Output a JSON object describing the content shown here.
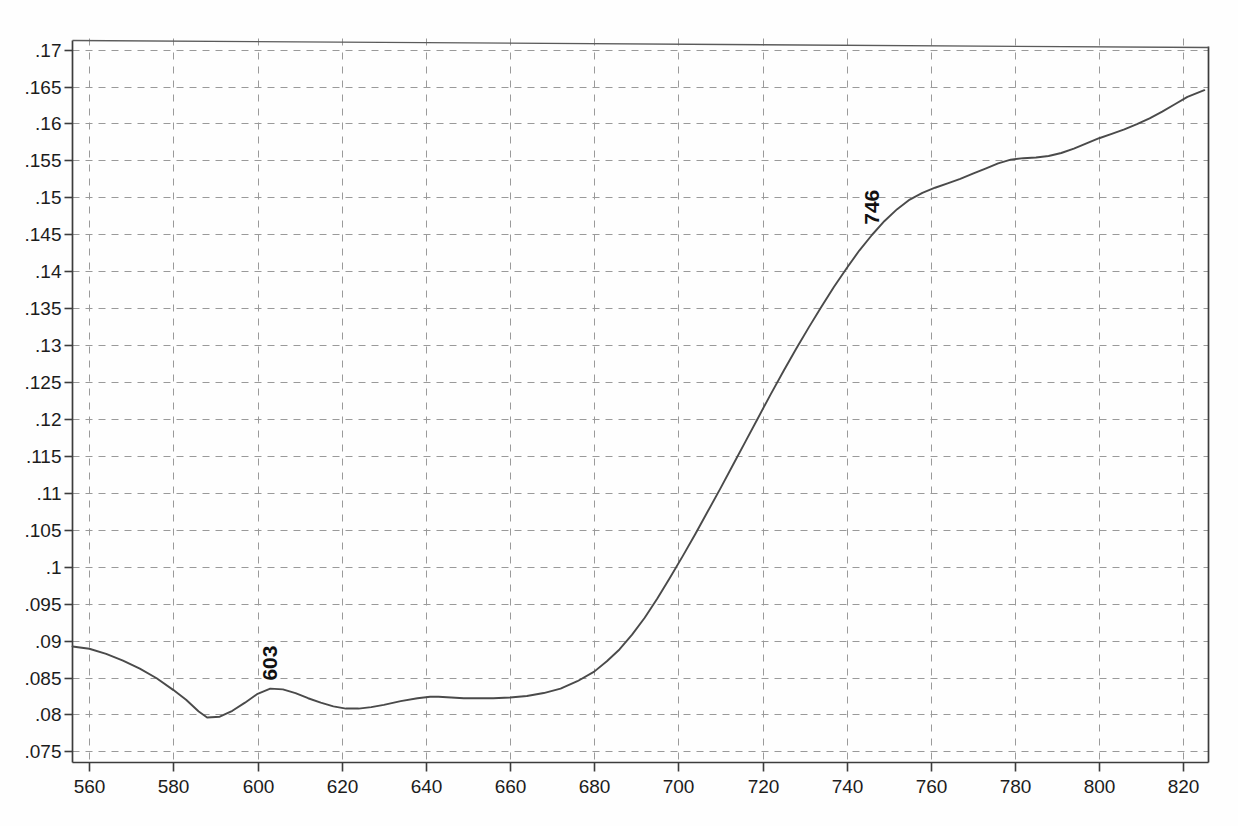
{
  "chart_data": {
    "type": "line",
    "title": "",
    "subtitle": "",
    "xlabel": "",
    "ylabel": "",
    "xlim": [
      556,
      826
    ],
    "ylim": [
      0.0735,
      0.1715
    ],
    "grid": true,
    "legend_position": "none",
    "x_tick_labels": [
      "560",
      "580",
      "600",
      "620",
      "640",
      "660",
      "680",
      "700",
      "720",
      "740",
      "760",
      "780",
      "800",
      "820"
    ],
    "x_ticks": [
      560,
      580,
      600,
      620,
      640,
      660,
      680,
      700,
      720,
      740,
      760,
      780,
      800,
      820
    ],
    "y_tick_labels": [
      ".17",
      ".165",
      ".16",
      ".155",
      ".15",
      ".145",
      ".14",
      ".135",
      ".13",
      ".125",
      ".12",
      ".115",
      ".11",
      ".105",
      ".1",
      ".095",
      ".09",
      ".085",
      ".08",
      ".075"
    ],
    "y_ticks": [
      0.17,
      0.165,
      0.16,
      0.155,
      0.15,
      0.145,
      0.14,
      0.135,
      0.13,
      0.125,
      0.12,
      0.115,
      0.11,
      0.105,
      0.1,
      0.095,
      0.09,
      0.085,
      0.08,
      0.075
    ],
    "line_color": "#4a4a4a",
    "grid_color": "#9a9a9a",
    "axis_color": "#3c3c3c",
    "annotations": [
      {
        "label": "603",
        "x": 603,
        "y": 0.0835,
        "rotation": -90
      },
      {
        "label": "746",
        "x": 746,
        "y": 0.1452,
        "rotation": -90
      }
    ],
    "series": [
      {
        "name": "absorbance",
        "x": [
          556,
          560,
          564,
          568,
          572,
          576,
          580,
          583,
          586,
          588,
          591,
          594,
          597,
          600,
          603,
          606,
          609,
          612,
          615,
          618,
          621,
          624,
          627,
          630,
          634,
          638,
          641,
          643,
          646,
          649,
          652,
          656,
          660,
          664,
          668,
          672,
          676,
          680,
          683,
          686,
          689,
          692,
          695,
          698,
          701,
          704,
          707,
          710,
          713,
          716,
          719,
          722,
          725,
          728,
          731,
          734,
          737,
          740,
          743,
          746,
          749,
          752,
          755,
          758,
          761,
          764,
          767,
          770,
          773,
          776,
          779,
          782,
          785,
          788,
          791,
          794,
          797,
          800,
          803,
          806,
          809,
          812,
          815,
          818,
          821,
          825
        ],
        "values": [
          0.0892,
          0.0889,
          0.0882,
          0.0873,
          0.0862,
          0.0849,
          0.0833,
          0.082,
          0.0804,
          0.0796,
          0.0797,
          0.0805,
          0.0816,
          0.0828,
          0.0835,
          0.0834,
          0.0829,
          0.0822,
          0.0816,
          0.0811,
          0.0808,
          0.0808,
          0.081,
          0.0813,
          0.0818,
          0.0822,
          0.0824,
          0.0824,
          0.0823,
          0.0822,
          0.0822,
          0.0822,
          0.0823,
          0.0825,
          0.0829,
          0.0835,
          0.0845,
          0.0858,
          0.0872,
          0.0888,
          0.0908,
          0.0931,
          0.0957,
          0.0985,
          0.1014,
          0.1044,
          0.1075,
          0.1106,
          0.1138,
          0.117,
          0.1202,
          0.1234,
          0.1265,
          0.1295,
          0.1324,
          0.1352,
          0.1379,
          0.1404,
          0.1428,
          0.1449,
          0.1468,
          0.1484,
          0.1497,
          0.1506,
          0.1513,
          0.1519,
          0.1525,
          0.1532,
          0.1539,
          0.1546,
          0.1551,
          0.1553,
          0.1554,
          0.1556,
          0.156,
          0.1566,
          0.1573,
          0.158,
          0.1586,
          0.1592,
          0.1599,
          0.1607,
          0.1616,
          0.1626,
          0.1636,
          0.1645
        ]
      }
    ]
  }
}
